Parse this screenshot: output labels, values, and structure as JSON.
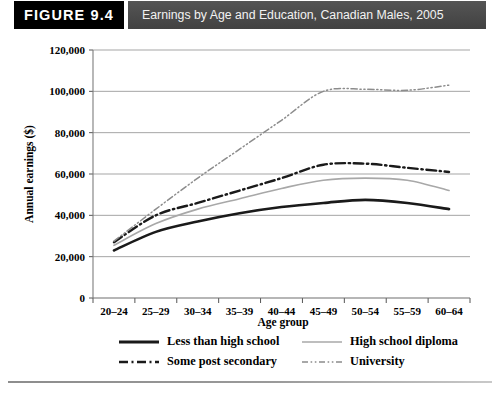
{
  "header": {
    "badge": "FIGURE 9.4",
    "title": "Earnings by Age and Education, Canadian Males, 2005",
    "badge_color": "#000000",
    "title_bar_color": "#4a4a4a",
    "title_text_color": "#f2f2f2"
  },
  "chart_data": {
    "type": "line",
    "title": "Earnings by Age and Education, Canadian Males, 2005",
    "xlabel": "Age group",
    "ylabel": "Annual earnings ($)",
    "grid": true,
    "legend_position": "bottom",
    "ylim": [
      0,
      120000
    ],
    "yticks": [
      0,
      20000,
      40000,
      60000,
      80000,
      100000,
      120000
    ],
    "ytick_labels": [
      "0",
      "20,000",
      "40,000",
      "60,000",
      "80,000",
      "100,000",
      "120,000"
    ],
    "categories": [
      "20–24",
      "25–29",
      "30–34",
      "35–39",
      "40–44",
      "45–49",
      "50–54",
      "55–59",
      "60–64"
    ],
    "series": [
      {
        "name": "Less than high school",
        "style": "solid",
        "color": "#1a1a1a",
        "width": 2.6,
        "values": [
          23000,
          32000,
          37000,
          41000,
          44000,
          46000,
          47500,
          46000,
          43000
        ]
      },
      {
        "name": "High school diploma",
        "style": "solid",
        "color": "#a8a8a8",
        "width": 1.6,
        "values": [
          25500,
          36000,
          43000,
          48000,
          53000,
          57000,
          58000,
          57000,
          52000
        ]
      },
      {
        "name": "Some post secondary",
        "style": "dashdot",
        "color": "#1a1a1a",
        "width": 2.4,
        "values": [
          27000,
          40000,
          46000,
          52000,
          58000,
          64500,
          65000,
          63000,
          61000
        ]
      },
      {
        "name": "University",
        "style": "dashdotdot",
        "color": "#8c8c8c",
        "width": 1.5,
        "values": [
          27500,
          43000,
          58000,
          72000,
          86000,
          100000,
          101000,
          100500,
          103000
        ]
      }
    ]
  },
  "legend": {
    "entries": [
      {
        "label": "Less than high school",
        "swatch": "solid-thick-black"
      },
      {
        "label": "High school diploma",
        "swatch": "solid-thin-gray"
      },
      {
        "label": "Some post secondary",
        "swatch": "dashdot-thick-black"
      },
      {
        "label": "University",
        "swatch": "dashdotdot-thin-gray"
      }
    ]
  }
}
